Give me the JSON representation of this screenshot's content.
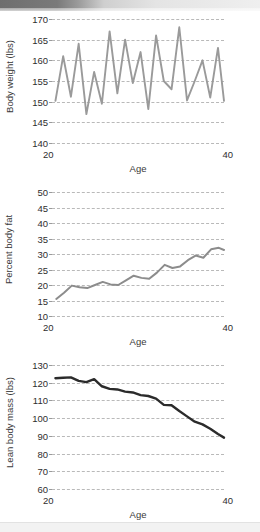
{
  "banner": {
    "text": "· · · · · · · · · · · ·"
  },
  "charts": [
    {
      "name": "body-weight",
      "ylabel": "Body weight (lbs)",
      "xlabel": "Age",
      "yticks": [
        170,
        165,
        160,
        155,
        150,
        145,
        140
      ],
      "xticks": [
        20,
        40
      ],
      "ylim": [
        140,
        170
      ],
      "xlim": [
        20,
        40
      ],
      "color": "#9a9a9a",
      "stroke": 1.9,
      "chart_data": {
        "type": "line",
        "title": "Body weight vs Age",
        "xlabel": "Age",
        "ylabel": "Body weight (lbs)",
        "xlim": [
          20,
          40
        ],
        "ylim": [
          140,
          170
        ],
        "grid": true,
        "legend": "none",
        "x": [
          20.4,
          21.3,
          22.2,
          23.1,
          24.0,
          24.9,
          25.8,
          26.7,
          27.6,
          28.5,
          29.4,
          30.3,
          31.2,
          32.1,
          33.0,
          33.9,
          34.8,
          35.7,
          36.6,
          37.5,
          38.4,
          39.3,
          40.0
        ],
        "y": [
          150.2,
          161.0,
          151.2,
          164.0,
          147.0,
          157.2,
          149.5,
          167.0,
          152.0,
          165.0,
          154.5,
          162.0,
          148.2,
          166.0,
          155.0,
          153.0,
          168.0,
          150.3,
          155.0,
          160.0,
          151.0,
          163.0,
          150.2
        ]
      }
    },
    {
      "name": "percent-body-fat",
      "ylabel": "Percent body fat",
      "xlabel": "Age",
      "yticks": [
        50,
        45,
        40,
        35,
        30,
        25,
        20,
        15,
        10
      ],
      "xticks": [
        20,
        40
      ],
      "ylim": [
        10,
        50
      ],
      "xlim": [
        20,
        40
      ],
      "color": "#8c8c8c",
      "stroke": 2.0,
      "chart_data": {
        "type": "line",
        "title": "Percent body fat vs Age",
        "xlabel": "Age",
        "ylabel": "Percent body fat",
        "xlim": [
          20,
          40
        ],
        "ylim": [
          10,
          50
        ],
        "grid": true,
        "legend": "none",
        "x": [
          20.5,
          21.4,
          22.3,
          23.2,
          24.1,
          25.0,
          25.9,
          26.8,
          27.7,
          28.6,
          29.5,
          30.4,
          31.3,
          32.2,
          33.1,
          34.0,
          34.9,
          35.8,
          36.7,
          37.6,
          38.5,
          39.4,
          40.0
        ],
        "y": [
          15.5,
          17.5,
          19.8,
          19.3,
          19.0,
          20.0,
          21.0,
          20.2,
          20.0,
          21.5,
          23.0,
          22.3,
          22.0,
          24.0,
          26.5,
          25.5,
          26.0,
          28.0,
          29.5,
          28.8,
          31.5,
          32.0,
          31.3
        ]
      }
    },
    {
      "name": "lean-body-mass",
      "ylabel": "Lean body mass (lbs)",
      "xlabel": "Age",
      "yticks": [
        130,
        120,
        110,
        100,
        90,
        80,
        70,
        60
      ],
      "xticks": [
        20,
        40
      ],
      "ylim": [
        60,
        130
      ],
      "xlim": [
        20,
        40
      ],
      "color": "#2b2b2b",
      "stroke": 2.4,
      "chart_data": {
        "type": "line",
        "title": "Lean body mass vs Age",
        "xlabel": "Age",
        "ylabel": "Lean body mass (lbs)",
        "xlim": [
          20,
          40
        ],
        "ylim": [
          60,
          130
        ],
        "grid": true,
        "legend": "none",
        "x": [
          20.4,
          21.3,
          22.2,
          23.1,
          24.0,
          24.9,
          25.8,
          26.7,
          27.6,
          28.5,
          29.4,
          30.3,
          31.2,
          32.1,
          33.0,
          33.9,
          34.8,
          35.7,
          36.6,
          37.5,
          38.4,
          39.3,
          40.0
        ],
        "y": [
          122.5,
          122.8,
          123.0,
          121.0,
          120.3,
          122.0,
          118.0,
          116.5,
          116.2,
          115.0,
          114.5,
          113.0,
          112.5,
          111.0,
          107.5,
          107.3,
          104.0,
          101.0,
          98.0,
          96.5,
          94.0,
          91.0,
          89.0
        ]
      }
    }
  ]
}
